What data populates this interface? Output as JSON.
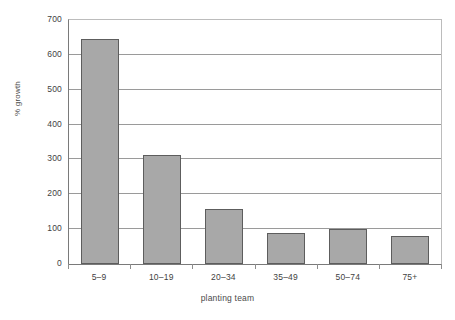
{
  "top_crop_remnant": "",
  "chart_data": {
    "type": "bar",
    "title": "",
    "xlabel": "planting team",
    "ylabel": "% growth",
    "categories": [
      "5–9",
      "10–19",
      "20–34",
      "35–49",
      "50–74",
      "75+"
    ],
    "values": [
      645,
      313,
      157,
      90,
      100,
      80
    ],
    "ylim": [
      0,
      700
    ],
    "yticks": [
      0,
      100,
      200,
      300,
      400,
      500,
      600,
      700
    ],
    "ytick_labels": [
      "0",
      "100",
      "200",
      "300",
      "400",
      "500",
      "600",
      "700"
    ],
    "grid": true,
    "legend": false,
    "bar_color": "#a8a8a8",
    "bar_border_color": "#5d5d5d",
    "gridline_color": "#9a9a9a",
    "axis_color": "#7a7a7a",
    "background_color": "#ffffff"
  }
}
